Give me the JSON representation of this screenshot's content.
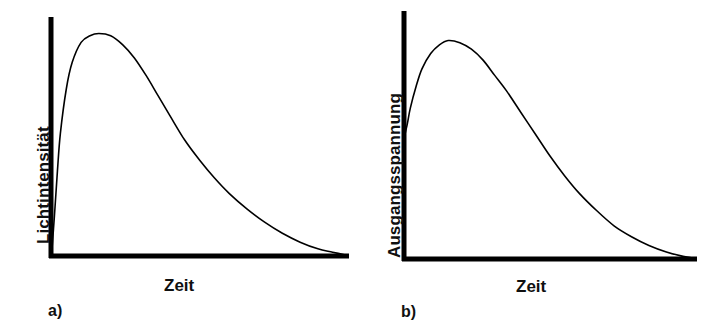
{
  "figure": {
    "background_color": "#ffffff",
    "ink_color": "#000000",
    "width": 705,
    "height": 330
  },
  "panels": [
    {
      "letter": "a)",
      "ylabel": "Lichtintensität",
      "xlabel": "Zeit"
    },
    {
      "letter": "b)",
      "ylabel": "Ausgangsspannung",
      "xlabel": "Zeit"
    }
  ],
  "chart_data": [
    {
      "type": "line",
      "title": "",
      "subtitle": "",
      "xlabel": "Zeit",
      "ylabel": "Lichtintensität",
      "panel_label": "a)",
      "grid": false,
      "legend": "none",
      "axes": {
        "style": "L-shaped spine, thick black, no ticks, no tick labels",
        "xlim": [
          0,
          1
        ],
        "ylim": [
          0,
          1
        ]
      },
      "series": [
        {
          "name": "Lichtintensität",
          "color": "#000000",
          "line_width": 1.6,
          "x": [
            0.0,
            0.01,
            0.02,
            0.03,
            0.05,
            0.07,
            0.1,
            0.13,
            0.16,
            0.2,
            0.24,
            0.28,
            0.32,
            0.36,
            0.4,
            0.45,
            0.5,
            0.55,
            0.6,
            0.66,
            0.72,
            0.78,
            0.84,
            0.9,
            0.95,
            1.0
          ],
          "y": [
            0.0,
            0.18,
            0.38,
            0.55,
            0.75,
            0.87,
            0.96,
            0.99,
            1.0,
            0.99,
            0.95,
            0.89,
            0.81,
            0.72,
            0.63,
            0.52,
            0.43,
            0.35,
            0.28,
            0.21,
            0.15,
            0.1,
            0.06,
            0.03,
            0.015,
            0.0
          ]
        }
      ],
      "annotations": []
    },
    {
      "type": "line",
      "title": "",
      "subtitle": "",
      "xlabel": "Zeit",
      "ylabel": "Ausgangsspannung",
      "panel_label": "b)",
      "grid": false,
      "legend": "none",
      "axes": {
        "style": "L-shaped spine, thick black, no ticks, no tick labels",
        "xlim": [
          0,
          1
        ],
        "ylim": [
          0,
          1
        ]
      },
      "series": [
        {
          "name": "Ausgangsspannung",
          "color": "#000000",
          "line_width": 1.6,
          "x": [
            0.0,
            0.01,
            0.02,
            0.04,
            0.06,
            0.09,
            0.12,
            0.15,
            0.19,
            0.23,
            0.27,
            0.31,
            0.35,
            0.4,
            0.45,
            0.5,
            0.55,
            0.6,
            0.66,
            0.72,
            0.78,
            0.84,
            0.9,
            0.95,
            1.0
          ],
          "y": [
            0.56,
            0.62,
            0.69,
            0.79,
            0.87,
            0.94,
            0.98,
            1.0,
            0.99,
            0.96,
            0.91,
            0.84,
            0.77,
            0.67,
            0.57,
            0.47,
            0.38,
            0.3,
            0.22,
            0.15,
            0.1,
            0.06,
            0.03,
            0.012,
            0.0
          ]
        }
      ],
      "annotations": [
        {
          "text": "curve begins at a raised offset on the vertical axis",
          "at_x": 0.0,
          "at_y": 0.56
        }
      ]
    }
  ]
}
